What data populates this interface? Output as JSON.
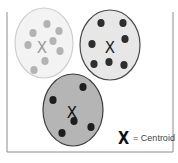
{
  "diagram": {
    "frame": {
      "x": 7,
      "y": 8,
      "width": 166,
      "height": 144,
      "stroke": "#8c8c8c"
    },
    "clusters": [
      {
        "name": "cluster-1",
        "cx": 44,
        "cy": 43,
        "rx": 29,
        "ry": 35,
        "fill": "#f3f3f3",
        "stroke": "#cfcfcf",
        "dot_color": "#b3b3b3",
        "centroid": {
          "x": 42,
          "y": 47,
          "color": "#9a9a9a"
        },
        "points": [
          [
            47,
            24
          ],
          [
            33,
            33
          ],
          [
            59,
            31
          ],
          [
            28,
            45
          ],
          [
            53,
            41
          ],
          [
            60,
            51
          ],
          [
            45,
            61
          ],
          [
            34,
            70
          ]
        ]
      },
      {
        "name": "cluster-2",
        "cx": 110,
        "cy": 45,
        "rx": 30,
        "ry": 35,
        "fill": "#e7e7e7",
        "stroke": "#4a4a4a",
        "dot_color": "#2e2e2e",
        "centroid": {
          "x": 110,
          "y": 47,
          "color": "#222222"
        },
        "points": [
          [
            101,
            23
          ],
          [
            123,
            23
          ],
          [
            92,
            44
          ],
          [
            125,
            39
          ],
          [
            94,
            64
          ],
          [
            109,
            62
          ],
          [
            124,
            65
          ]
        ]
      },
      {
        "name": "cluster-3",
        "cx": 73,
        "cy": 110,
        "rx": 30,
        "ry": 36,
        "fill": "#b5b5b5",
        "stroke": "#3c3c3c",
        "dot_color": "#1e1e1e",
        "centroid": {
          "x": 72,
          "y": 112,
          "color": "#111111"
        },
        "points": [
          [
            83,
            87
          ],
          [
            53,
            100
          ],
          [
            74,
            121
          ],
          [
            91,
            127
          ],
          [
            62,
            133
          ]
        ]
      }
    ],
    "legend": {
      "symbol": "X",
      "label": "= Centroid"
    }
  }
}
